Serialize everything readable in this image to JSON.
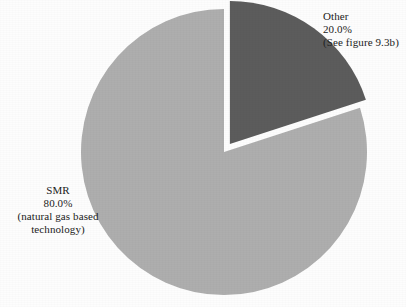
{
  "chart_data": {
    "type": "pie",
    "title": "",
    "subtitle": "",
    "xlabel": "",
    "ylabel": "",
    "grid": false,
    "legend_position": "none",
    "start_angle_deg": 0,
    "direction": "clockwise",
    "categories": [
      "SMR",
      "Other"
    ],
    "values": [
      80.0,
      20.0
    ],
    "units": "percent",
    "slices": [
      {
        "name": "SMR",
        "value": 80.0,
        "value_label": "80.0%",
        "color": "#aeaeae",
        "exploded": false,
        "label_lines": [
          "SMR",
          "80.0%",
          "(natural gas based",
          "technology)"
        ],
        "annotation": "(natural gas based technology)"
      },
      {
        "name": "Other",
        "value": 20.0,
        "value_label": "20.0%",
        "color": "#5c5c5c",
        "exploded": true,
        "label_lines": [
          "Other",
          "20.0%",
          "(See figure 9.3b)"
        ],
        "annotation": "(See figure 9.3b)"
      }
    ]
  },
  "labels": {
    "other": {
      "name": "Other",
      "percent": "20.0%",
      "note": "(See figure 9.3b)"
    },
    "smr": {
      "name": "SMR",
      "percent": "80.0%",
      "note_line1": "(natural gas based",
      "note_line2": "technology)"
    }
  },
  "colors": {
    "background": "#fdfdfd",
    "slice_other": "#5c5c5c",
    "slice_smr": "#aeaeae",
    "separator": "#ffffff",
    "text": "#222222"
  }
}
